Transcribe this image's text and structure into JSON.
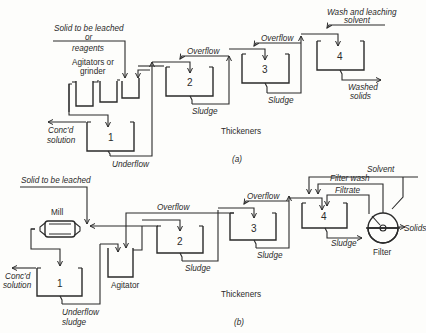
{
  "diagram_a": {
    "caption": "(a)",
    "section_label": "Thickeners",
    "labels": {
      "feed_line1": "Solid to be leached",
      "feed_line2": "or",
      "feed_line3": "reagents",
      "agitators_line1": "Agitators or",
      "agitators_line2": "grinder",
      "conc_line1": "Conc'd",
      "conc_line2": "solution",
      "underflow_line1": "Underflow",
      "underflow_line2": "sludge",
      "overflow_1": "Overflow",
      "overflow_2": "Overflow",
      "sludge_1": "Sludge",
      "sludge_2": "Sludge",
      "wash_line1": "Wash and leaching",
      "wash_line2": "solvent",
      "washed_line1": "Washed",
      "washed_line2": "solids"
    },
    "thickeners": [
      "1",
      "2",
      "3",
      "4"
    ]
  },
  "diagram_b": {
    "caption": "(b)",
    "section_label": "Thickeners",
    "labels": {
      "feed": "Solid to be leached",
      "mill": "Mill",
      "agitator": "Agitator",
      "conc_line1": "Conc'd",
      "conc_line2": "solution",
      "underflow_line1": "Underflow",
      "underflow_line2": "sludge",
      "overflow_1": "Overflow",
      "overflow_2": "Overflow",
      "sludge_1": "Sludge",
      "sludge_2": "Sludge",
      "sludge_3": "Sludge",
      "solvent": "Solvent",
      "filter_wash": "Filter wash",
      "filtrate": "Filtrate",
      "solids": "Solids",
      "filter": "Filter"
    },
    "thickeners": [
      "1",
      "2",
      "3",
      "4"
    ]
  }
}
